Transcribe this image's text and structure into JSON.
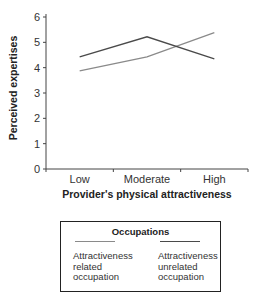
{
  "chart_data": {
    "type": "line",
    "title": "",
    "xlabel": "Provider's physical attractiveness",
    "ylabel": "Perceived expertises",
    "categories": [
      "Low",
      "Moderate",
      "High"
    ],
    "ylim": [
      0,
      6
    ],
    "yticks": [
      "0",
      "1",
      "2",
      "3",
      "4",
      "5",
      "6"
    ],
    "grid": false,
    "legend_position": "bottom (boxed, below x-axis title)",
    "legend_title": "Occupations",
    "series": [
      {
        "name": "Attractiveness related occupation",
        "color": "#8a8a8a",
        "values": [
          3.87,
          4.43,
          5.38
        ]
      },
      {
        "name": "Attractiveness unrelated occupation",
        "color": "#4a4a4a",
        "values": [
          4.43,
          5.22,
          4.35
        ]
      }
    ]
  },
  "legend": {
    "title": "Occupations",
    "entries": [
      {
        "lines": [
          "Attractiveness",
          "related",
          "occupation"
        ],
        "color": "#8a8a8a"
      },
      {
        "lines": [
          "Attractiveness",
          "unrelated",
          "occupation"
        ],
        "color": "#4a4a4a"
      }
    ]
  }
}
